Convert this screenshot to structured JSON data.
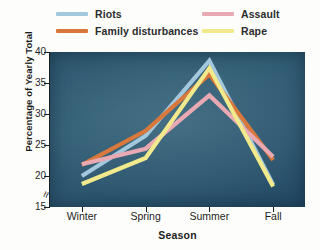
{
  "chart_data": {
    "type": "line",
    "title": "",
    "xlabel": "Season",
    "ylabel": "Percentage of Yearly Total",
    "categories": [
      "Winter",
      "Spring",
      "Summer",
      "Fall"
    ],
    "ylim": [
      15,
      40
    ],
    "yticks": [
      15,
      20,
      25,
      30,
      35,
      40
    ],
    "grid": false,
    "axis_break": true,
    "legend_position": "top",
    "series": [
      {
        "name": "Riots",
        "color": "#a3c8dd",
        "values": [
          20.0,
          26.5,
          38.6,
          18.6
        ]
      },
      {
        "name": "Family disturbances",
        "color": "#d9783c",
        "values": [
          21.8,
          27.3,
          36.4,
          22.6
        ]
      },
      {
        "name": "Assault",
        "color": "#e9a9b2",
        "values": [
          21.9,
          24.4,
          33.0,
          23.1
        ]
      },
      {
        "name": "Rape",
        "color": "#f2e98c",
        "values": [
          18.7,
          22.9,
          37.4,
          18.3
        ]
      }
    ]
  },
  "figure": {
    "plot_background_color": "#2a5468",
    "page_background_color": "#fdfdfb",
    "axis_break_glyph": "≈"
  }
}
